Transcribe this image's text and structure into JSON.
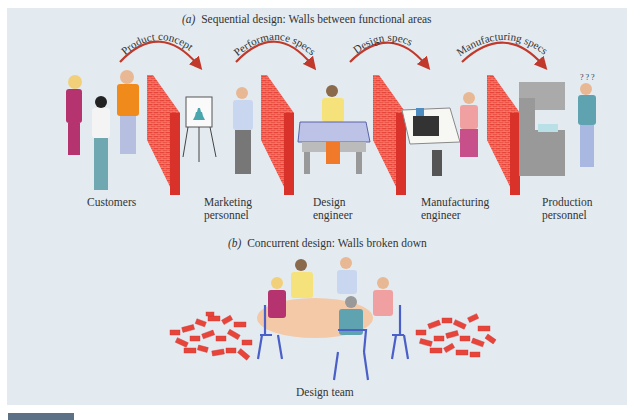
{
  "figure": {
    "part_a": {
      "letter": "(a)",
      "title": "Sequential design: Walls between functional areas",
      "handoffs": [
        {
          "label": "Product concept"
        },
        {
          "label": "Performance specs"
        },
        {
          "label": "Design specs"
        },
        {
          "label": "Manufacturing specs"
        }
      ],
      "roles": [
        {
          "line1": "Customers",
          "line2": ""
        },
        {
          "line1": "Marketing",
          "line2": "personnel"
        },
        {
          "line1": "Design",
          "line2": "engineer"
        },
        {
          "line1": "Manufacturing",
          "line2": "engineer"
        },
        {
          "line1": "Production",
          "line2": "personnel"
        }
      ]
    },
    "part_b": {
      "letter": "(b)",
      "title": "Concurrent design: Walls broken down",
      "team_label": "Design team"
    },
    "colors": {
      "background": "#e3ebf1",
      "brick": "#e8453a",
      "arrow": "#c0392b",
      "footer_tab": "#5d7186"
    }
  }
}
